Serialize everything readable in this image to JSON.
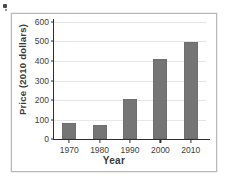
{
  "figure": {
    "frame_border_color": "#b8b8b8",
    "background_color": "#ffffff",
    "bar_color": "#757575",
    "axis_color": "#2e2e2e",
    "grid_color": "#e6e6e6"
  },
  "chart_data": {
    "type": "bar",
    "title": "",
    "xlabel": "Year",
    "ylabel": "Price (2010 dollars)",
    "categories": [
      "1970",
      "1980",
      "1990",
      "2000",
      "2010"
    ],
    "values": [
      82,
      72,
      205,
      410,
      497
    ],
    "ylim": [
      0,
      600
    ],
    "yticks": [
      0,
      100,
      200,
      300,
      400,
      500,
      600
    ],
    "ytick_labels": [
      "0",
      "100",
      "200",
      "300",
      "400",
      "500",
      "600"
    ],
    "grid": true,
    "grid_axis": "y",
    "legend": null,
    "legend_position": "none",
    "bar_color": "#757575",
    "annotations": []
  }
}
